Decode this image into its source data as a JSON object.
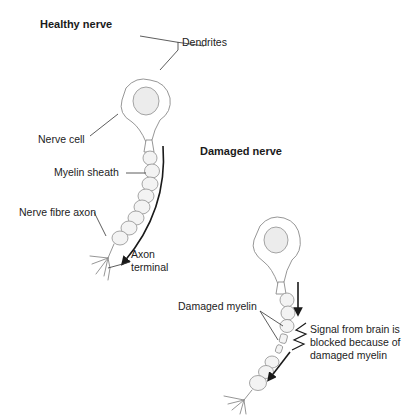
{
  "healthy": {
    "title": "Healthy nerve",
    "labels": {
      "dendrites": "Dendrites",
      "nerve_cell": "Nerve cell",
      "myelin_sheath": "Myelin sheath",
      "nerve_fibre_axon": "Nerve fibre axon",
      "axon_terminal": "Axon terminal"
    }
  },
  "damaged": {
    "title": "Damaged nerve",
    "labels": {
      "damaged_myelin": "Damaged myelin",
      "signal_blocked": "Signal from brain is blocked because of damaged myelin"
    }
  }
}
